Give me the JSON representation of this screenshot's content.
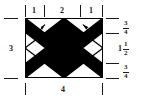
{
  "figure": {
    "colors": {
      "ink": "#1a1a1a",
      "fill_dark": "#000000",
      "fill_light": "#ffffff"
    }
  },
  "top_dimensions": {
    "segments": [
      {
        "label": "1"
      },
      {
        "label": "2"
      },
      {
        "label": "1"
      }
    ]
  },
  "left_dimension": {
    "label": "3"
  },
  "bottom_dimension": {
    "label": "4"
  },
  "right_dimensions": {
    "segments": [
      {
        "whole": "",
        "numerator": "3",
        "denominator": "4"
      },
      {
        "whole": "1",
        "numerator": "1",
        "denominator": "2"
      },
      {
        "whole": "",
        "numerator": "3",
        "denominator": "4"
      }
    ]
  },
  "interior_arrows": [
    {
      "label": "1"
    },
    {
      "label": "1"
    }
  ]
}
